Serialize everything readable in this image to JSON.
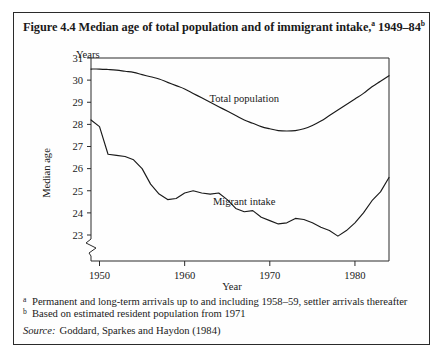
{
  "figure": {
    "title_main": "Figure 4.4  Median age of total population and of immigrant intake,",
    "title_sup_a": "a",
    "title_years": " 1949–84",
    "title_sup_b": "b"
  },
  "footnotes": [
    {
      "mark": "a",
      "text": "Permanent and long-term arrivals up to and including 1958–59, settler arrivals thereafter"
    },
    {
      "mark": "b",
      "text": "Based on estimated resident population from 1971"
    }
  ],
  "source": {
    "label": "Source:",
    "text": "Goddard, Sparkes and Haydon (1984)"
  },
  "chart_data": {
    "type": "line",
    "xlabel": "Year",
    "ylabel": "Median age",
    "y_unit_label": "Years",
    "xlim": [
      1949,
      1984
    ],
    "ylim": [
      22.6,
      31
    ],
    "xticks": [
      1950,
      1960,
      1970,
      1980
    ],
    "yticks": [
      23,
      24,
      25,
      26,
      27,
      28,
      29,
      30,
      31
    ],
    "axis_break": true,
    "grid": false,
    "legend_position": "inline-annotations",
    "series": [
      {
        "name": "Total population",
        "label_x": 1967,
        "label_y": 29.0,
        "x": [
          1949,
          1950,
          1951,
          1952,
          1953,
          1954,
          1955,
          1956,
          1957,
          1958,
          1959,
          1960,
          1961,
          1962,
          1963,
          1964,
          1965,
          1966,
          1967,
          1968,
          1969,
          1970,
          1971,
          1972,
          1973,
          1974,
          1975,
          1976,
          1977,
          1978,
          1979,
          1980,
          1981,
          1982,
          1983,
          1984
        ],
        "values": [
          30.5,
          30.5,
          30.48,
          30.45,
          30.4,
          30.35,
          30.25,
          30.15,
          30.05,
          29.9,
          29.75,
          29.6,
          29.4,
          29.2,
          29.0,
          28.8,
          28.6,
          28.4,
          28.2,
          28.05,
          27.9,
          27.8,
          27.72,
          27.7,
          27.72,
          27.8,
          27.95,
          28.15,
          28.4,
          28.65,
          28.9,
          29.15,
          29.4,
          29.7,
          29.95,
          30.2
        ]
      },
      {
        "name": "Migrant intake",
        "label_x": 1967,
        "label_y": 24.35,
        "x": [
          1949,
          1950,
          1951,
          1952,
          1953,
          1954,
          1955,
          1956,
          1957,
          1958,
          1959,
          1960,
          1961,
          1962,
          1963,
          1964,
          1965,
          1966,
          1967,
          1968,
          1969,
          1970,
          1971,
          1972,
          1973,
          1974,
          1975,
          1976,
          1977,
          1978,
          1979,
          1980,
          1981,
          1982,
          1983,
          1984
        ],
        "values": [
          28.2,
          27.9,
          26.65,
          26.6,
          26.55,
          26.4,
          26.0,
          25.3,
          24.85,
          24.6,
          24.65,
          24.9,
          25.0,
          24.9,
          24.85,
          24.9,
          24.6,
          24.2,
          24.05,
          24.1,
          23.8,
          23.65,
          23.5,
          23.55,
          23.75,
          23.7,
          23.55,
          23.35,
          23.2,
          22.95,
          23.2,
          23.55,
          24.0,
          24.55,
          24.95,
          25.6
        ]
      }
    ]
  }
}
